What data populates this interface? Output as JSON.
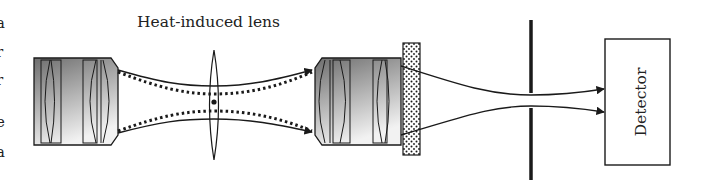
{
  "diagram": {
    "title_label": "Heat-induced lens",
    "detector_label": "Detector",
    "left_edge_fragments": [
      "a",
      "r",
      "r",
      "e",
      "a"
    ],
    "components": [
      {
        "id": "objective-1",
        "type": "objective-lens",
        "x": 34,
        "y": 58,
        "w": 84,
        "h": 87
      },
      {
        "id": "thermal-lens",
        "type": "thin-lens",
        "x": 214,
        "y1": 50,
        "y2": 160
      },
      {
        "id": "objective-2",
        "type": "objective-lens",
        "x": 315,
        "y": 58,
        "w": 86,
        "h": 87
      },
      {
        "id": "filter",
        "type": "dotted-filter",
        "x": 403,
        "y": 43,
        "w": 17,
        "h": 112
      },
      {
        "id": "pinhole",
        "type": "aperture",
        "x": 531,
        "y1": 20,
        "y2": 180
      },
      {
        "id": "detector",
        "type": "detector-box",
        "x": 605,
        "y": 39,
        "w": 65,
        "h": 126
      }
    ],
    "colors": {
      "stroke": "#1a1a1a",
      "objective_gradient_dark": "#6e6e6e",
      "objective_gradient_light": "#f2f2f2",
      "filter_dot": "#1a1a1a",
      "background": "#ffffff"
    }
  }
}
